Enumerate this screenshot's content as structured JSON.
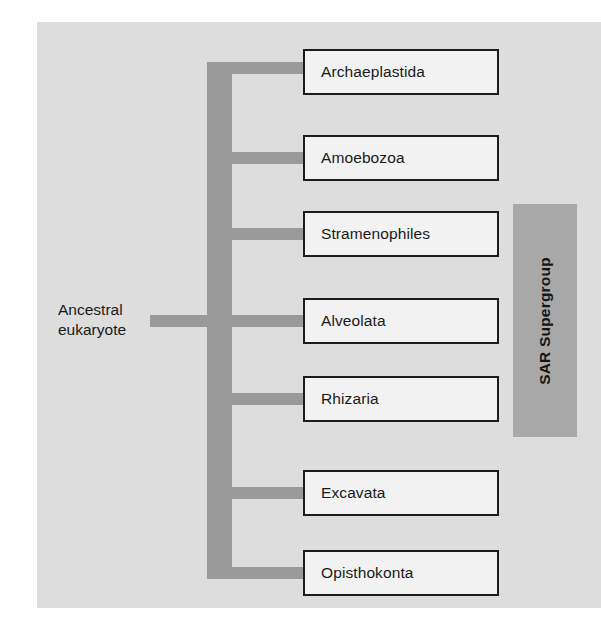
{
  "diagram": {
    "root": {
      "label": "Ancestral\neukaryote"
    },
    "colors": {
      "panel_background": "#dddddd",
      "connector": "#9a9a9a",
      "box_fill": "#f2f2f2",
      "box_border": "#1c1c1c",
      "sar_fill": "#a8a8a8",
      "text": "#1a1a1a"
    },
    "taxa": [
      {
        "label": "Archaeplastida",
        "sar_member": false
      },
      {
        "label": "Amoebozoa",
        "sar_member": false
      },
      {
        "label": "Stramenophiles",
        "sar_member": true
      },
      {
        "label": "Alveolata",
        "sar_member": true
      },
      {
        "label": "Rhizaria",
        "sar_member": true
      },
      {
        "label": "Excavata",
        "sar_member": false
      },
      {
        "label": "Opisthokonta",
        "sar_member": false
      }
    ],
    "bracket": {
      "label": "SAR Supergroup",
      "covers": [
        "Stramenophiles",
        "Alveolata",
        "Rhizaria"
      ]
    }
  }
}
